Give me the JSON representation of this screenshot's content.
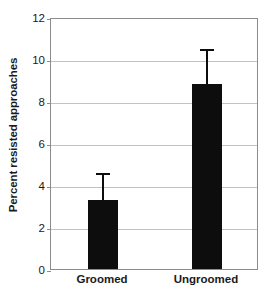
{
  "chart_data": {
    "type": "bar",
    "title": "",
    "xlabel": "",
    "ylabel": "Percent resisted approaches",
    "categories": [
      "Groomed",
      "Ungroomed"
    ],
    "values": [
      3.3,
      8.8
    ],
    "errors_upper": [
      4.65,
      10.55
    ],
    "error_type": "upper-whisker-only",
    "ylim": [
      0,
      12
    ],
    "yticks": [
      0,
      2,
      4,
      6,
      8,
      10,
      12
    ],
    "ytick_labels": [
      "0",
      "2",
      "4",
      "6",
      "8",
      "10",
      "12"
    ],
    "grid": true,
    "grid_axis": "y",
    "legend": false,
    "series": [
      {
        "name": "Percent resisted approaches",
        "values": [
          3.3,
          8.8
        ],
        "errors_upper": [
          4.65,
          10.55
        ],
        "color": "#0d0d0d"
      }
    ]
  },
  "colors": {
    "bar": "#0d0d0d",
    "gridline": "#c2c2c2",
    "frame": "#8c8c8c",
    "text": "#1a1a1a",
    "background": "#ffffff"
  }
}
